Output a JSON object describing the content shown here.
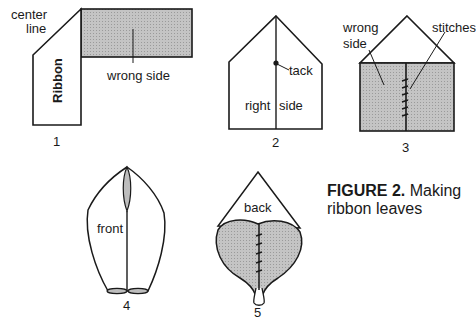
{
  "figure": {
    "caption_bold": "FIGURE 2.",
    "caption_text": " Making ribbon leaves",
    "colors": {
      "ink": "#1a1a1a",
      "shade": "#bdbdbd",
      "paper": "#ffffff"
    }
  },
  "steps": [
    {
      "number": "1",
      "labels": {
        "center_line_1": "center",
        "center_line_2": "line",
        "ribbon": "Ribbon",
        "wrong_side": "wrong side"
      }
    },
    {
      "number": "2",
      "labels": {
        "tack": "tack",
        "right": "right",
        "side": "side"
      }
    },
    {
      "number": "3",
      "labels": {
        "wrong": "wrong",
        "side": "side",
        "stitches": "stitches"
      }
    },
    {
      "number": "4",
      "labels": {
        "front": "front"
      }
    },
    {
      "number": "5",
      "labels": {
        "back": "back"
      }
    }
  ]
}
